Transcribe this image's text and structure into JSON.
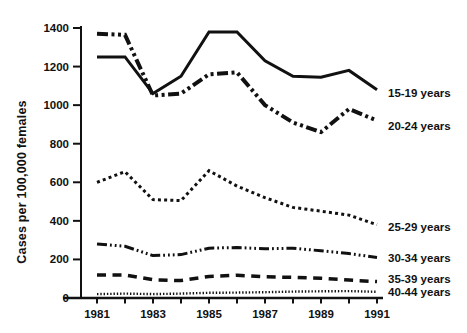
{
  "figure": {
    "background": "#ffffff",
    "ink_color": "#111111"
  },
  "chart_data": {
    "type": "line",
    "title": "",
    "xlabel": "",
    "ylabel": "Cases per 100,000 females",
    "x": [
      1981,
      1982,
      1983,
      1984,
      1985,
      1986,
      1987,
      1988,
      1989,
      1990,
      1991
    ],
    "xticks_labeled": [
      1981,
      1983,
      1985,
      1987,
      1989,
      1991
    ],
    "ylim": [
      0,
      1400
    ],
    "yticks": [
      0,
      200,
      400,
      600,
      800,
      1000,
      1200,
      1400
    ],
    "grid": false,
    "legend_position": "right of line ends",
    "series": [
      {
        "name": "15-19 years",
        "style": "solid",
        "width": 3,
        "values": [
          1250,
          1250,
          1060,
          1150,
          1380,
          1380,
          1230,
          1150,
          1145,
          1180,
          1080
        ]
      },
      {
        "name": "20-24 years",
        "style": "dash-dot-dot",
        "width": 4,
        "values": [
          1370,
          1365,
          1050,
          1060,
          1160,
          1170,
          1000,
          910,
          860,
          980,
          920
        ]
      },
      {
        "name": "25-29 years",
        "style": "dotted",
        "width": 3,
        "values": [
          600,
          655,
          510,
          505,
          660,
          580,
          520,
          470,
          450,
          430,
          380
        ]
      },
      {
        "name": "30-34 years",
        "style": "dash-3dots",
        "width": 3,
        "values": [
          280,
          268,
          220,
          225,
          258,
          262,
          255,
          258,
          245,
          230,
          210
        ]
      },
      {
        "name": "35-39 years",
        "style": "dashed",
        "width": 3.5,
        "values": [
          120,
          120,
          95,
          90,
          112,
          118,
          110,
          107,
          102,
          93,
          85
        ]
      },
      {
        "name": "40-44 years",
        "style": "fine-dotted",
        "width": 2.4,
        "values": [
          20,
          23,
          20,
          23,
          27,
          28,
          30,
          33,
          35,
          36,
          32
        ]
      }
    ]
  }
}
